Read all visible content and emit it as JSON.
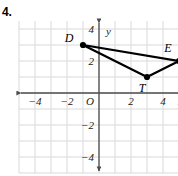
{
  "problem": {
    "number": "4."
  },
  "chart_data": {
    "type": "scatter",
    "title": "",
    "subtitle": "",
    "xlabel": "x",
    "ylabel": "y",
    "xlim": [
      -5,
      5.5
    ],
    "ylim": [
      -5,
      4.5
    ],
    "grid": true,
    "grid_step": 1,
    "legend": null,
    "xticks": [
      -4,
      -2,
      2,
      4
    ],
    "xticklabels": [
      "−4",
      "−2",
      "2",
      "4"
    ],
    "yticks": [
      4,
      2,
      -2,
      -4
    ],
    "yticklabels": [
      "4",
      "2",
      "−2",
      "−4"
    ],
    "origin_label": "O",
    "points": [
      {
        "label": "D",
        "x": -1,
        "y": 3,
        "label_dx": -14,
        "label_dy": -3
      },
      {
        "label": "T",
        "x": 3,
        "y": 1,
        "label_dx": -5,
        "label_dy": 15
      },
      {
        "label": "E",
        "x": 5,
        "y": 2,
        "label_dx": -11,
        "label_dy": -9
      }
    ],
    "segments": [
      {
        "from": "D",
        "to": "E"
      },
      {
        "from": "D",
        "to": "T"
      },
      {
        "from": "T",
        "to": "E"
      }
    ],
    "colors": {
      "grid": "#d9d9d9",
      "axis": "#4d4d4d",
      "shape_stroke": "#000000",
      "point_fill": "#000000",
      "text": "#1a1a1a",
      "background": "#ffffff"
    }
  }
}
